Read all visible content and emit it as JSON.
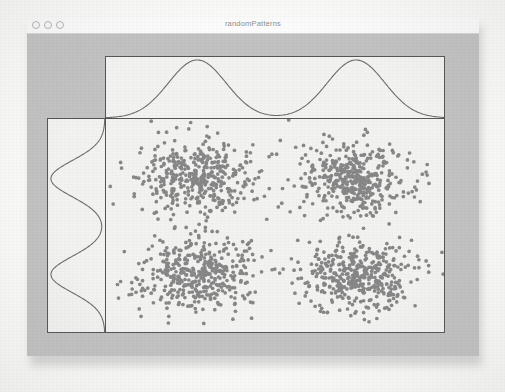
{
  "window": {
    "title": "randomPatterns",
    "traffic_lights": [
      "close",
      "minimize",
      "zoom"
    ],
    "chrome_color": "#c2c2c2",
    "title_bar_color": "#fcfcfc"
  },
  "chart_data": {
    "type": "scatter",
    "title": "randomPatterns",
    "xlabel": "",
    "ylabel": "",
    "xlim": [
      0,
      1
    ],
    "ylim": [
      0,
      1
    ],
    "grid": false,
    "legend": "none",
    "point_color": "#878787",
    "point_size": 3,
    "panel_background": "#f2f2f0",
    "axis_color": "#555555",
    "clusters": [
      {
        "name": "top-left",
        "center_x": 0.27,
        "center_y": 0.72,
        "sd_x": 0.085,
        "sd_y": 0.085,
        "n": 420
      },
      {
        "name": "top-right",
        "center_x": 0.74,
        "center_y": 0.72,
        "sd_x": 0.085,
        "sd_y": 0.085,
        "n": 420
      },
      {
        "name": "bottom-left",
        "center_x": 0.27,
        "center_y": 0.27,
        "sd_x": 0.085,
        "sd_y": 0.085,
        "n": 420
      },
      {
        "name": "bottom-right",
        "center_x": 0.74,
        "center_y": 0.27,
        "sd_x": 0.085,
        "sd_y": 0.085,
        "n": 420
      }
    ],
    "marginal_top": {
      "type": "line",
      "orientation": "horizontal",
      "curve_color": "#6b6b6b",
      "modes": [
        {
          "mean": 0.27,
          "sd": 0.085,
          "weight": 0.5
        },
        {
          "mean": 0.74,
          "sd": 0.085,
          "weight": 0.5
        }
      ]
    },
    "marginal_left": {
      "type": "line",
      "orientation": "vertical",
      "curve_color": "#6b6b6b",
      "modes": [
        {
          "mean": 0.27,
          "sd": 0.085,
          "weight": 0.5
        },
        {
          "mean": 0.72,
          "sd": 0.085,
          "weight": 0.5
        }
      ]
    }
  }
}
